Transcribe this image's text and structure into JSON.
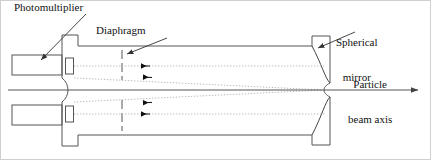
{
  "figure": {
    "background": "#ffffff",
    "line_color": "#555555",
    "dotted_color": "#b9b9b9",
    "text_color": "#111111",
    "width": 431,
    "height": 160
  },
  "labels": {
    "photomultiplier": "Photomultiplier",
    "diaphragm": "Diaphragm",
    "spherical_mirror_line1": "Spherical",
    "spherical_mirror_line2": "mirror",
    "particle_beam_line1": "Particle",
    "particle_beam_line2": "beam axis"
  },
  "components": {
    "photomultiplier_top": "photomultiplier-box-top",
    "photomultiplier_bottom": "photomultiplier-box-bottom",
    "light_guide_top": "light-guide-top",
    "light_guide_bottom": "light-guide-bottom",
    "vessel": "radiator-vessel-outline",
    "entrance_window": "curved-entrance-window",
    "diaphragm_top": "diaphragm-line-top",
    "diaphragm_bottom": "diaphragm-line-bottom",
    "mirror": "spherical-mirror-curve",
    "beam_axis": "particle-beam-axis-line",
    "rays": "reflected-light-ray-paths"
  },
  "geometry": {
    "beam_axis_y": 90,
    "beam_axis_x_start": 8,
    "beam_axis_x_end": 420,
    "mirror_x": 320,
    "diaphragm_x": 122,
    "ray_arrow_x": 143,
    "vessel_left_x": 78,
    "vessel_right_x": 330,
    "vessel_top_y": 40,
    "vessel_bottom_y": 143
  }
}
